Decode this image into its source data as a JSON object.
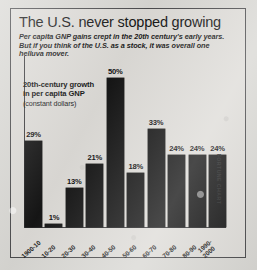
{
  "headline": "The U.S. never stopped growing",
  "subhead": "Per capita GNP gains crept in the 20th century's early years. But if you think of the U.S. as a stock, it was overall one helluva mover.",
  "legend": {
    "line1": "20th-century growth",
    "line2": "in per capita GNP",
    "line3": "(constant dollars)"
  },
  "credit": "FORTUNE CHART",
  "chart_data": {
    "type": "bar",
    "title": "The U.S. never stopped growing",
    "subtitle": "Per capita GNP gains crept in the 20th century's early years. But if you think of the U.S. as a stock, it was overall one helluva mover.",
    "series_label": "20th-century growth in per capita GNP (constant dollars)",
    "xlabel": "",
    "ylabel": "",
    "ylim": [
      0,
      50
    ],
    "grid": false,
    "legend_position": "upper-left-inset",
    "bar_color": "#161616",
    "categories": [
      "1900-10",
      "10-20",
      "20-30",
      "30-40",
      "40-50",
      "50-60",
      "60-70",
      "70-80",
      "80-90",
      "1990-\n2000"
    ],
    "values": [
      29,
      1,
      13,
      21,
      50,
      18,
      33,
      24,
      24,
      24
    ],
    "value_labels": [
      "29%",
      "1%",
      "13%",
      "21%",
      "50%",
      "18%",
      "33%",
      "24%",
      "24%",
      "24%"
    ]
  }
}
